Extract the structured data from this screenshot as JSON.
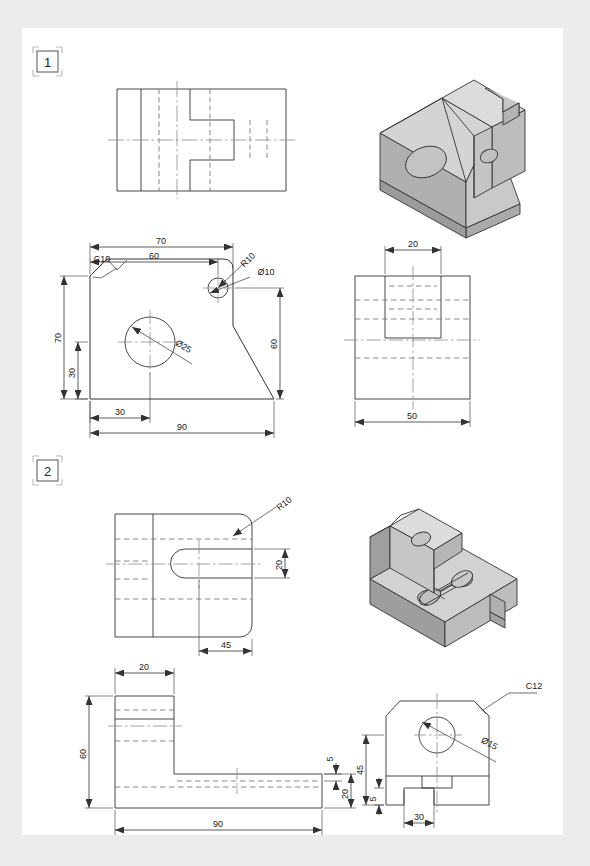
{
  "page": {
    "background_color": "#ececec",
    "sheet_color": "#ffffff",
    "line_color": "#333333",
    "iso_fill_top": "#d9d9d9",
    "iso_fill_front": "#c2c2c2",
    "iso_fill_side": "#a8a8a8"
  },
  "exercises": [
    {
      "marker": "1",
      "views": {
        "top_view": {
          "name": "top-view"
        },
        "isometric": {
          "name": "isometric-view"
        },
        "front_view": {
          "name": "front-view",
          "dimensions": [
            "70",
            "60",
            "C10",
            "R10",
            "Ø10",
            "70",
            "30",
            "Ø25",
            "60",
            "30",
            "90"
          ]
        },
        "side_view": {
          "name": "side-view",
          "dimensions": [
            "20",
            "50"
          ]
        }
      }
    },
    {
      "marker": "2",
      "views": {
        "top_view": {
          "name": "top-view",
          "dimensions": [
            "R10",
            "20",
            "45"
          ]
        },
        "isometric": {
          "name": "isometric-view"
        },
        "front_view": {
          "name": "front-view",
          "dimensions": [
            "20",
            "60",
            "5",
            "20",
            "90"
          ]
        },
        "side_view": {
          "name": "side-view",
          "dimensions": [
            "C12",
            "Ø15",
            "45",
            "5",
            "30"
          ]
        }
      }
    }
  ],
  "labels": {
    "ex1_marker": "1",
    "ex2_marker": "2",
    "d_70": "70",
    "d_60": "60",
    "d_c10": "C10",
    "d_r10": "R10",
    "d_dia10": "Ø10",
    "d_70v": "70",
    "d_30v": "30",
    "d_dia25": "Ø25",
    "d_60v": "60",
    "d_30h": "30",
    "d_90": "90",
    "d_20top": "20",
    "d_50": "50",
    "e2_r10": "R10",
    "e2_20r": "20",
    "e2_45": "45",
    "e2_20t": "20",
    "e2_60": "60",
    "e2_5": "5",
    "e2_20b": "20",
    "e2_90": "90",
    "e2_c12": "C12",
    "e2_dia15": "Ø15",
    "e2_45v": "45",
    "e2_5v": "5",
    "e2_30": "30"
  }
}
